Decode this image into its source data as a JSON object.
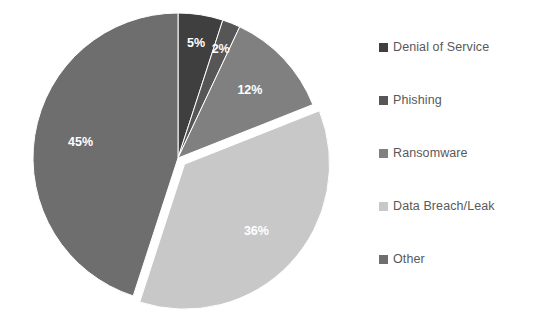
{
  "chart_data": {
    "type": "pie",
    "title": "",
    "categories": [
      "Denial of Service",
      "Phishing",
      "Ransomware",
      "Data Breach/Leak",
      "Other"
    ],
    "values": [
      5,
      2,
      12,
      36,
      45
    ],
    "value_labels": [
      "5%",
      "2%",
      "12%",
      "36%",
      "45%"
    ],
    "units": "percent",
    "legend_position": "right",
    "grid": false,
    "start_angle_deg": 0,
    "direction": "clockwise",
    "exploded_slices": [
      "Data Breach/Leak"
    ],
    "colors": [
      "#3f3f3f",
      "#565656",
      "#808080",
      "#c8c8c8",
      "#6e6e6e"
    ],
    "label_color": "#ffffff",
    "background": "#ffffff"
  },
  "legend": {
    "items": [
      {
        "label": "Denial of Service",
        "color": "#3f3f3f",
        "swatch_name": "legend-swatch-denial-of-service"
      },
      {
        "label": "Phishing",
        "color": "#565656",
        "swatch_name": "legend-swatch-phishing"
      },
      {
        "label": "Ransomware",
        "color": "#808080",
        "swatch_name": "legend-swatch-ransomware"
      },
      {
        "label": "Data Breach/Leak",
        "color": "#c8c8c8",
        "swatch_name": "legend-swatch-data-breach-leak"
      },
      {
        "label": "Other",
        "color": "#6e6e6e",
        "swatch_name": "legend-swatch-other"
      }
    ]
  },
  "slices": [
    {
      "label": "5%",
      "category": "Denial of Service",
      "value": 5,
      "color": "#3f3f3f"
    },
    {
      "label": "2%",
      "category": "Phishing",
      "value": 2,
      "color": "#565656"
    },
    {
      "label": "12%",
      "category": "Ransomware",
      "value": 12,
      "color": "#808080"
    },
    {
      "label": "36%",
      "category": "Data Breach/Leak",
      "value": 36,
      "color": "#c8c8c8"
    },
    {
      "label": "45%",
      "category": "Other",
      "value": 45,
      "color": "#6e6e6e"
    }
  ]
}
